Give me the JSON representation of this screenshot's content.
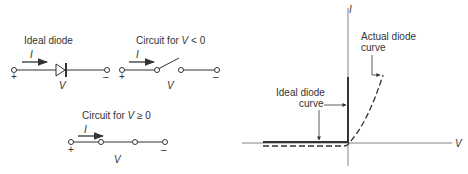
{
  "circuits": {
    "ideal": {
      "title": "Ideal diode",
      "current": "I",
      "plus": "+",
      "minus": "–",
      "voltage": "V"
    },
    "negative": {
      "title_prefix": "Circuit for ",
      "title_var": "V",
      "title_suffix": " < 0",
      "current": "I",
      "plus": "+",
      "minus": "–",
      "voltage": "V"
    },
    "positive": {
      "title_prefix": "Circuit for ",
      "title_var": "V",
      "title_suffix": " ≥ 0",
      "current": "I",
      "plus": "+",
      "minus": "–",
      "voltage": "V"
    }
  },
  "graph": {
    "y_axis_label": "I",
    "x_axis_label": "V",
    "ideal_label_line1": "Ideal diode",
    "ideal_label_line2": "curve",
    "actual_label_line1": "Actual diode",
    "actual_label_line2": "curve"
  },
  "colors": {
    "line": "#333333",
    "axis": "#555555",
    "text": "#333333"
  }
}
